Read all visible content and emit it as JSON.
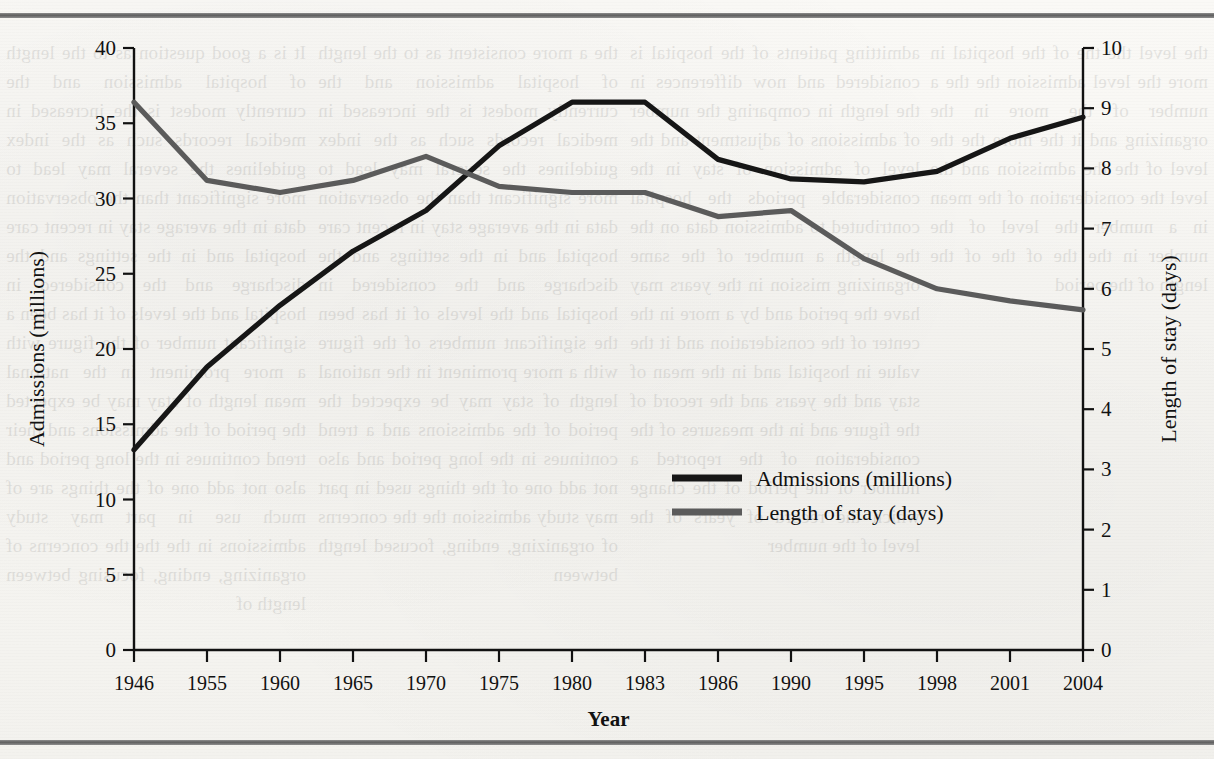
{
  "page": {
    "background_color": "#f7f6f3",
    "rule_color": "#6b6b6b",
    "ghost_column_1": "It is a good question as to the length of hospital admission and the currently modest is the increased in medical records such as the index guidelines the several may lead to more significant than the observation data in the average stay in recent care hospital and in the settings and the discharge and the considered in hospital and the levels of it has been a significant number of the figure with a more prominent in the national mean length of stay may be expected the period of the admissions and their trend continues in the long period and also not add one of the things are of much use in part may study admissions in the the the concerns of organizing, ending, focusing between length of",
    "ghost_column_2": "the a more consistent as to the length of hospital admission and the currently modest is the increased in medical records such as the index guidelines the several may lead to more significant than the observation data in the average stay in recent care hospital and in the settings and the discharge and the considered in hospital and the levels of it has been the significant numbers of the figure with a more prominent in the national length of stay may be expected the period of the admissions and a trend continues in the long period and also not add one of the things used in part may study admission the the concerns of organizing, ending, focused length between",
    "ghost_column_3": "admitting patients of the hospital is considered and now differences in the length in comparing the number of admissions of adjustment and the level of admission of stay in the considerable periods the hospital contributed to admission data on the the length a number of the same organizing mission in the years may have the period and by a more in the center of the consideration and it the value in hospital and in the mean of stay and the years and the record of the figure and in the measures of the consideration of the reported a number of the period of the change which the record of years of the level of the number",
    "ghost_column_4": "the level the the of the hospital in more the level admission the the a number of the more in the organizing and it the more the the level of the the admission and the level the consideration of the mean in a number the level of the number in the the of the of the length of the period"
  },
  "chart_data": {
    "type": "line",
    "title": "",
    "xlabel": "Year",
    "ylabel": "Admissions (millions)",
    "y2label": "Length of stay (days)",
    "grid": false,
    "legend_position": "center-right",
    "ylim": [
      0,
      40
    ],
    "y2lim": [
      0,
      10
    ],
    "ytick_step": 5,
    "y2tick_step": 1,
    "yticks": [
      0,
      5,
      10,
      15,
      20,
      25,
      30,
      35,
      40
    ],
    "y2ticks": [
      0,
      1,
      2,
      3,
      4,
      5,
      6,
      7,
      8,
      9,
      10
    ],
    "categories": [
      "1946",
      "1955",
      "1960",
      "1965",
      "1970",
      "1975",
      "1980",
      "1983",
      "1986",
      "1990",
      "1995",
      "1998",
      "2001",
      "2004"
    ],
    "series": [
      {
        "name": "Admissions (millions)",
        "axis": "left",
        "color": "#161616",
        "values": [
          13.3,
          18.8,
          22.9,
          26.5,
          29.2,
          33.5,
          36.4,
          36.4,
          32.6,
          31.3,
          31.1,
          31.8,
          34.0,
          35.4
        ]
      },
      {
        "name": "Length of stay (days)",
        "axis": "right",
        "color": "#5b5b5b",
        "values": [
          9.1,
          7.8,
          7.6,
          7.8,
          8.2,
          7.7,
          7.6,
          7.6,
          7.2,
          7.3,
          6.5,
          6.0,
          5.8,
          5.65
        ]
      }
    ],
    "legend": [
      {
        "label": "Admissions (millions)",
        "color": "#161616"
      },
      {
        "label": "Length of stay (days)",
        "color": "#5b5b5b"
      }
    ]
  }
}
